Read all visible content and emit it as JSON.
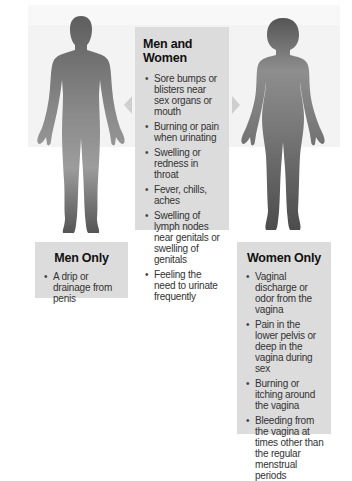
{
  "center": {
    "title": "Men and Women",
    "items": [
      "Sore bumps or blisters near sex organs or mouth",
      "Burning or pain when urinating",
      "Swelling or redness in throat",
      "Fever, chills, aches",
      "Swelling of lymph nodes near genitals or swelling of genitals",
      "Feeling the need to urinate frequently"
    ]
  },
  "men": {
    "title": "Men Only",
    "items": [
      "A drip or drainage from penis"
    ]
  },
  "women": {
    "title": "Women Only",
    "items": [
      "Vaginal discharge or odor from the vagina",
      "Pain in the lower pelvis or deep in the vagina during sex",
      "Burning or itching around the vagina",
      "Bleeding from the vagina at times other than the regular menstrual periods"
    ]
  },
  "figures": {
    "left": "male-silhouette",
    "right": "female-silhouette"
  },
  "colors": {
    "box": "#dcdcdc",
    "frame": "#f3f3f3",
    "silhouette_dark": "#5a5a5a",
    "silhouette_light": "#9a9a9a",
    "arrow": "#cfcfcf"
  }
}
